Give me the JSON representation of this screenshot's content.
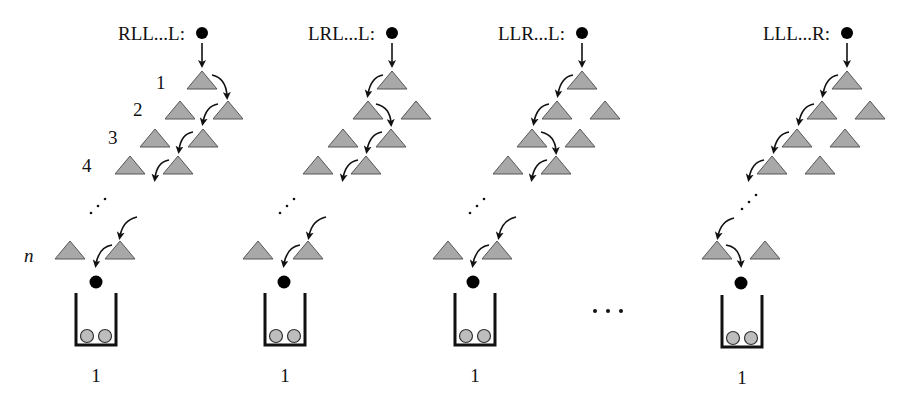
{
  "figure": {
    "row_labels": [
      "1",
      "2",
      "3",
      "4",
      "n"
    ],
    "middle_ellipsis": "…",
    "colors": {
      "peg_fill": "#a8a8a8",
      "peg_stroke": "#555555",
      "ball": "#000000",
      "bucket_ball": "#bdbdbd",
      "ink": "#111111"
    },
    "panels": [
      {
        "path_label": "RLL...L:",
        "bucket_label": "1",
        "ball_x": 202,
        "rows": [
          {
            "pegs": [
              202
            ],
            "turn": "R"
          },
          {
            "pegs": [
              180,
              228
            ],
            "turn": "L"
          },
          {
            "pegs": [
              155,
              203
            ],
            "turn": "L"
          },
          {
            "pegs": [
              130,
              178
            ],
            "turn": "L"
          }
        ],
        "row_n": {
          "pegs": [
            70,
            120
          ],
          "turn": "L"
        },
        "bucket_x": 96
      },
      {
        "path_label": "LRL...L:",
        "bucket_label": "1",
        "ball_x": 392,
        "rows": [
          {
            "pegs": [
              392
            ],
            "turn": "L"
          },
          {
            "pegs": [
              368,
              416
            ],
            "turn": "R"
          },
          {
            "pegs": [
              343,
              391
            ],
            "turn": "L"
          },
          {
            "pegs": [
              318,
              366
            ],
            "turn": "L"
          }
        ],
        "row_n": {
          "pegs": [
            258,
            308
          ],
          "turn": "L"
        },
        "bucket_x": 284
      },
      {
        "path_label": "LLR...L:",
        "bucket_label": "1",
        "ball_x": 582,
        "rows": [
          {
            "pegs": [
              582
            ],
            "turn": "L"
          },
          {
            "pegs": [
              557,
              605
            ],
            "turn": "L"
          },
          {
            "pegs": [
              532,
              580
            ],
            "turn": "R"
          },
          {
            "pegs": [
              508,
              556
            ],
            "turn": "L"
          }
        ],
        "row_n": {
          "pegs": [
            448,
            497
          ],
          "turn": "L"
        },
        "bucket_x": 473
      },
      {
        "path_label": "LLL...R:",
        "bucket_label": "1",
        "ball_x": 847,
        "rows": [
          {
            "pegs": [
              847
            ],
            "turn": "L"
          },
          {
            "pegs": [
              822,
              870
            ],
            "turn": "L"
          },
          {
            "pegs": [
              797,
              845
            ],
            "turn": "L"
          },
          {
            "pegs": [
              772,
              820
            ],
            "turn": "L"
          }
        ],
        "row_n": {
          "pegs": [
            717,
            765
          ],
          "turn": "R"
        },
        "bucket_x": 741
      }
    ]
  }
}
